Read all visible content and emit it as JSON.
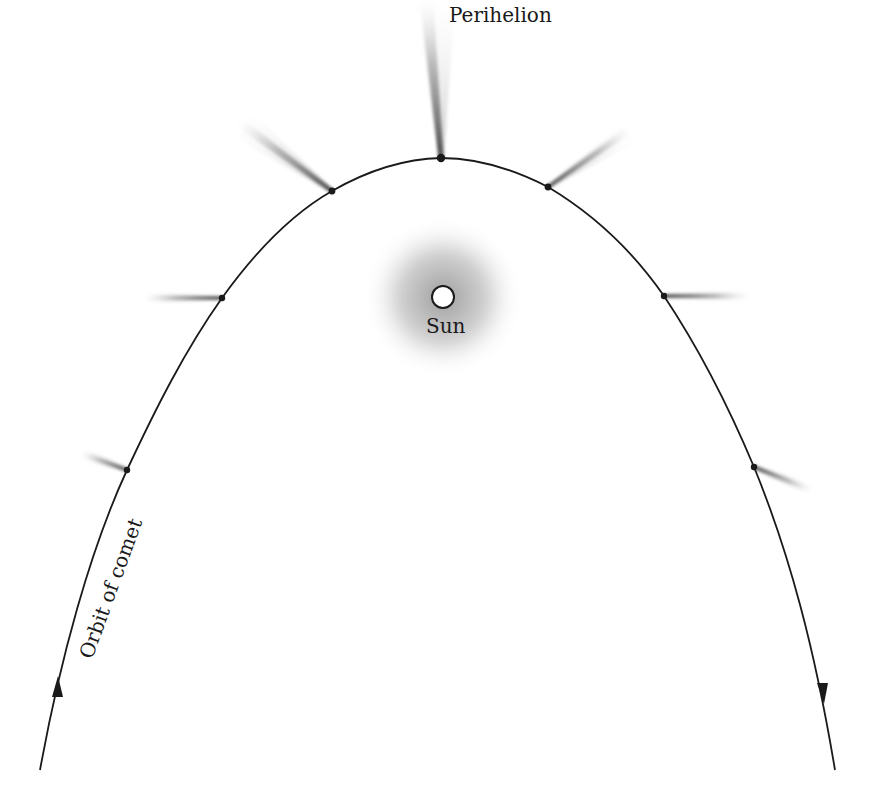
{
  "diagram": {
    "labels": {
      "perihelion": "Perihelion",
      "sun": "Sun",
      "orbit": "Orbit of comet"
    },
    "colors": {
      "orbit_line": "#1a1a1a",
      "tail": "#555555",
      "sun_glow": "#9a9a9a",
      "sun_fill": "#ffffff",
      "background": "#ffffff"
    },
    "sun": {
      "x": 443,
      "y": 297,
      "r": 11
    },
    "comet_positions": [
      {
        "x": 127,
        "y": 470,
        "tail_dir_deg": 200,
        "tail_len": 48
      },
      {
        "x": 222,
        "y": 298,
        "tail_dir_deg": 180,
        "tail_len": 78
      },
      {
        "x": 332,
        "y": 191,
        "tail_dir_deg": 217,
        "tail_len": 115
      },
      {
        "x": 441,
        "y": 158,
        "tail_dir_deg": 265,
        "tail_len": 158
      },
      {
        "x": 548,
        "y": 187,
        "tail_dir_deg": 325,
        "tail_len": 100
      },
      {
        "x": 664,
        "y": 296,
        "tail_dir_deg": 0,
        "tail_len": 85
      },
      {
        "x": 754,
        "y": 467,
        "tail_dir_deg": 20,
        "tail_len": 62
      }
    ],
    "direction_arrows": [
      {
        "position": "left-lower",
        "direction": "up"
      },
      {
        "position": "right-lower",
        "direction": "down"
      }
    ]
  }
}
